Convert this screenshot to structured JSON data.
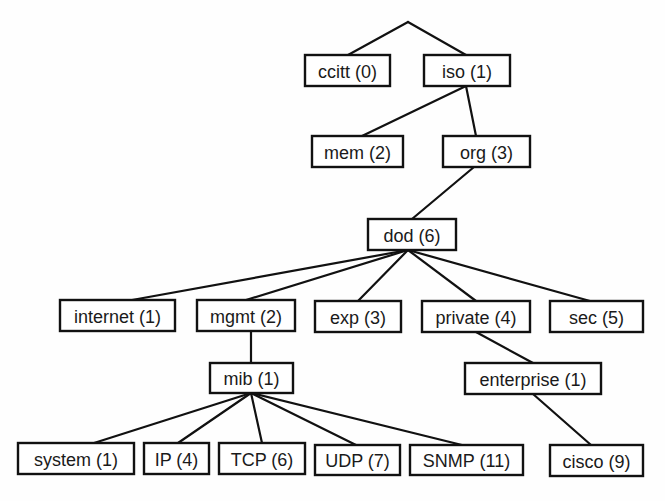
{
  "diagram": {
    "colors": {
      "line": "#111111",
      "box_fill": "#ffffff",
      "text": "#1a1a1a"
    },
    "root": {
      "x": 408,
      "y": 22
    },
    "nodes": [
      {
        "id": "ccitt",
        "label": "ccitt (0)",
        "x": 305,
        "y": 55,
        "w": 85,
        "h": 31
      },
      {
        "id": "iso",
        "label": "iso (1)",
        "x": 424,
        "y": 55,
        "w": 86,
        "h": 31
      },
      {
        "id": "mem",
        "label": "mem (2)",
        "x": 312,
        "y": 136,
        "w": 91,
        "h": 31
      },
      {
        "id": "org",
        "label": "org (3)",
        "x": 443,
        "y": 136,
        "w": 87,
        "h": 31
      },
      {
        "id": "dod",
        "label": "dod (6)",
        "x": 368,
        "y": 219,
        "w": 88,
        "h": 31
      },
      {
        "id": "internet",
        "label": "internet (1)",
        "x": 60,
        "y": 300,
        "w": 115,
        "h": 31
      },
      {
        "id": "mgmt",
        "label": "mgmt (2)",
        "x": 197,
        "y": 300,
        "w": 98,
        "h": 31
      },
      {
        "id": "exp",
        "label": "exp (3)",
        "x": 315,
        "y": 301,
        "w": 86,
        "h": 31
      },
      {
        "id": "private",
        "label": "private (4)",
        "x": 422,
        "y": 301,
        "w": 108,
        "h": 31
      },
      {
        "id": "sec",
        "label": "sec (5)",
        "x": 550,
        "y": 301,
        "w": 93,
        "h": 31
      },
      {
        "id": "mib",
        "label": "mib (1)",
        "x": 210,
        "y": 363,
        "w": 83,
        "h": 30
      },
      {
        "id": "enterprise",
        "label": "enterprise (1)",
        "x": 465,
        "y": 363,
        "w": 136,
        "h": 31
      },
      {
        "id": "system",
        "label": "system (1)",
        "x": 18,
        "y": 443,
        "w": 116,
        "h": 31
      },
      {
        "id": "ip",
        "label": "IP (4)",
        "x": 144,
        "y": 443,
        "w": 65,
        "h": 31
      },
      {
        "id": "tcp",
        "label": "TCP (6)",
        "x": 219,
        "y": 443,
        "w": 86,
        "h": 31
      },
      {
        "id": "udp",
        "label": "UDP (7)",
        "x": 315,
        "y": 445,
        "w": 85,
        "h": 30
      },
      {
        "id": "snmp",
        "label": "SNMP (11)",
        "x": 410,
        "y": 445,
        "w": 113,
        "h": 30
      },
      {
        "id": "cisco",
        "label": "cisco (9)",
        "x": 550,
        "y": 445,
        "w": 93,
        "h": 31
      }
    ],
    "edges": [
      {
        "from": "root",
        "to": "ccitt",
        "x1": 408,
        "y1": 22,
        "x2": 348,
        "y2": 55
      },
      {
        "from": "root",
        "to": "iso",
        "x1": 408,
        "y1": 22,
        "x2": 466,
        "y2": 55
      },
      {
        "from": "iso",
        "to": "mem",
        "x1": 466,
        "y1": 86,
        "x2": 362,
        "y2": 136
      },
      {
        "from": "iso",
        "to": "org",
        "x1": 466,
        "y1": 86,
        "x2": 476,
        "y2": 136
      },
      {
        "from": "org",
        "to": "dod",
        "x1": 474,
        "y1": 167,
        "x2": 412,
        "y2": 219
      },
      {
        "from": "dod",
        "to": "internet",
        "x1": 408,
        "y1": 250,
        "x2": 132,
        "y2": 300
      },
      {
        "from": "dod",
        "to": "mgmt",
        "x1": 408,
        "y1": 250,
        "x2": 246,
        "y2": 300
      },
      {
        "from": "dod",
        "to": "exp",
        "x1": 408,
        "y1": 250,
        "x2": 358,
        "y2": 301
      },
      {
        "from": "dod",
        "to": "private",
        "x1": 408,
        "y1": 250,
        "x2": 476,
        "y2": 301
      },
      {
        "from": "dod",
        "to": "sec",
        "x1": 408,
        "y1": 250,
        "x2": 590,
        "y2": 301
      },
      {
        "from": "mgmt",
        "to": "mib",
        "x1": 251,
        "y1": 331,
        "x2": 251,
        "y2": 363
      },
      {
        "from": "private",
        "to": "enterprise",
        "x1": 476,
        "y1": 332,
        "x2": 533,
        "y2": 363
      },
      {
        "from": "mib",
        "to": "system",
        "x1": 251,
        "y1": 393,
        "x2": 94,
        "y2": 443
      },
      {
        "from": "mib",
        "to": "ip",
        "x1": 251,
        "y1": 393,
        "x2": 178,
        "y2": 443
      },
      {
        "from": "mib",
        "to": "tcp",
        "x1": 251,
        "y1": 393,
        "x2": 262,
        "y2": 443
      },
      {
        "from": "mib",
        "to": "udp",
        "x1": 251,
        "y1": 393,
        "x2": 356,
        "y2": 445
      },
      {
        "from": "mib",
        "to": "snmp",
        "x1": 251,
        "y1": 393,
        "x2": 462,
        "y2": 445
      },
      {
        "from": "enterprise",
        "to": "cisco",
        "x1": 533,
        "y1": 394,
        "x2": 591,
        "y2": 445
      }
    ]
  }
}
